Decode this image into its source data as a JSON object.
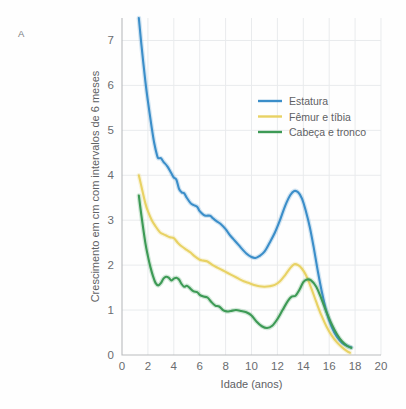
{
  "panel": {
    "label": "A"
  },
  "chart_data": {
    "type": "line",
    "title": "",
    "xlabel": "Idade (anos)",
    "ylabel": "Crescimento em cm com intervalos de 6 meses",
    "xlim": [
      0,
      20
    ],
    "ylim": [
      0,
      7.5
    ],
    "xticks": [
      "0",
      "2",
      "4",
      "6",
      "8",
      "10",
      "12",
      "14",
      "16",
      "18",
      "20"
    ],
    "xtick_values": [
      0,
      2,
      4,
      6,
      8,
      10,
      12,
      14,
      16,
      18,
      20
    ],
    "yticks": [
      "0",
      "1",
      "2",
      "3",
      "4",
      "5",
      "6",
      "7"
    ],
    "ytick_values": [
      0,
      1,
      2,
      3,
      4,
      5,
      6,
      7
    ],
    "grid": true,
    "legend_position": "upper-right-inside",
    "colors": {
      "estatura": "#3b8ec9",
      "femur_tibia": "#e8d264",
      "cabeca_tronco": "#3d9a55",
      "gridline": "#e9ebed",
      "axis": "#b9bbbd",
      "text": "#6a6c6f",
      "background": "#fefefe"
    },
    "series": [
      {
        "name": "Estatura",
        "color": "#3b8ec9",
        "x": [
          1.3,
          1.5,
          1.8,
          2.0,
          2.3,
          2.5,
          2.7,
          2.8,
          3.0,
          3.2,
          3.5,
          3.8,
          4.0,
          4.2,
          4.4,
          4.6,
          4.8,
          5.0,
          5.3,
          5.5,
          5.8,
          6.0,
          6.3,
          6.5,
          6.8,
          7.0,
          7.3,
          7.6,
          8.0,
          8.3,
          8.6,
          9.0,
          9.3,
          9.6,
          10.0,
          10.3,
          10.6,
          11.0,
          11.4,
          11.8,
          12.2,
          12.6,
          13.0,
          13.3,
          13.6,
          13.9,
          14.2,
          14.5,
          14.8,
          15.1,
          15.4,
          15.8,
          16.2,
          16.6,
          17.0,
          17.4,
          17.7
        ],
        "y": [
          7.5,
          6.9,
          6.1,
          5.65,
          5.05,
          4.7,
          4.45,
          4.38,
          4.38,
          4.3,
          4.2,
          4.05,
          3.95,
          3.9,
          3.7,
          3.62,
          3.6,
          3.5,
          3.38,
          3.34,
          3.3,
          3.2,
          3.12,
          3.1,
          3.1,
          3.05,
          2.98,
          2.92,
          2.8,
          2.68,
          2.58,
          2.45,
          2.35,
          2.26,
          2.18,
          2.16,
          2.2,
          2.3,
          2.5,
          2.72,
          3.0,
          3.32,
          3.56,
          3.65,
          3.62,
          3.48,
          3.2,
          2.85,
          2.4,
          1.9,
          1.45,
          0.95,
          0.62,
          0.4,
          0.27,
          0.2,
          0.17
        ]
      },
      {
        "name": "Fêmur e tíbia",
        "color": "#e8d264",
        "x": [
          1.3,
          1.5,
          1.8,
          2.0,
          2.3,
          2.6,
          2.9,
          3.1,
          3.4,
          3.7,
          4.0,
          4.3,
          4.6,
          5.0,
          5.3,
          5.6,
          6.0,
          6.3,
          6.6,
          7.0,
          7.4,
          7.8,
          8.2,
          8.6,
          9.0,
          9.4,
          9.8,
          10.2,
          10.6,
          11.0,
          11.4,
          11.8,
          12.2,
          12.6,
          13.0,
          13.3,
          13.6,
          13.9,
          14.2,
          14.6,
          15.0,
          15.4,
          15.8,
          16.2,
          16.6,
          17.0,
          17.4,
          17.6
        ],
        "y": [
          4.0,
          3.75,
          3.38,
          3.2,
          3.0,
          2.86,
          2.74,
          2.7,
          2.66,
          2.62,
          2.6,
          2.5,
          2.42,
          2.34,
          2.28,
          2.2,
          2.12,
          2.1,
          2.08,
          2.0,
          1.94,
          1.88,
          1.82,
          1.76,
          1.7,
          1.64,
          1.6,
          1.56,
          1.53,
          1.52,
          1.53,
          1.56,
          1.64,
          1.78,
          1.94,
          2.02,
          2.0,
          1.92,
          1.78,
          1.5,
          1.18,
          0.88,
          0.63,
          0.43,
          0.28,
          0.17,
          0.08,
          0.05
        ]
      },
      {
        "name": "Cabeça e tronco",
        "color": "#3d9a55",
        "x": [
          1.3,
          1.5,
          1.8,
          2.0,
          2.2,
          2.4,
          2.6,
          2.8,
          3.0,
          3.2,
          3.4,
          3.6,
          3.8,
          4.0,
          4.2,
          4.4,
          4.6,
          4.8,
          5.0,
          5.2,
          5.5,
          5.8,
          6.0,
          6.3,
          6.6,
          6.9,
          7.2,
          7.5,
          7.8,
          8.1,
          8.4,
          8.8,
          9.2,
          9.6,
          10.0,
          10.4,
          10.8,
          11.2,
          11.6,
          12.0,
          12.4,
          12.8,
          13.1,
          13.4,
          13.7,
          14.0,
          14.3,
          14.6,
          15.0,
          15.4,
          15.8,
          16.2,
          16.6,
          17.0,
          17.4,
          17.7
        ],
        "y": [
          3.55,
          3.1,
          2.5,
          2.2,
          1.95,
          1.75,
          1.6,
          1.55,
          1.6,
          1.7,
          1.74,
          1.72,
          1.66,
          1.7,
          1.72,
          1.68,
          1.58,
          1.52,
          1.54,
          1.5,
          1.42,
          1.4,
          1.34,
          1.3,
          1.28,
          1.18,
          1.1,
          1.08,
          1.0,
          0.97,
          0.98,
          1.0,
          0.98,
          0.95,
          0.88,
          0.74,
          0.64,
          0.6,
          0.65,
          0.8,
          1.0,
          1.2,
          1.3,
          1.32,
          1.45,
          1.62,
          1.68,
          1.66,
          1.52,
          1.25,
          0.95,
          0.68,
          0.46,
          0.3,
          0.2,
          0.16
        ]
      }
    ],
    "legend": [
      {
        "label": "Estatura",
        "color": "#3b8ec9"
      },
      {
        "label": "Fêmur e tíbia",
        "color": "#e8d264"
      },
      {
        "label": "Cabeça e tronco",
        "color": "#3d9a55"
      }
    ]
  }
}
